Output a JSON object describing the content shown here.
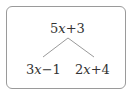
{
  "diagram": {
    "root": {
      "coef": "5",
      "var": "x",
      "rest": "+3"
    },
    "children": [
      {
        "coef": "3",
        "var": "x",
        "rest": "−1"
      },
      {
        "coef": "2",
        "var": "x",
        "rest": "+4"
      }
    ],
    "colors": {
      "border": "#9a9a9a",
      "line": "#9a9a9a",
      "text": "#333333"
    }
  }
}
